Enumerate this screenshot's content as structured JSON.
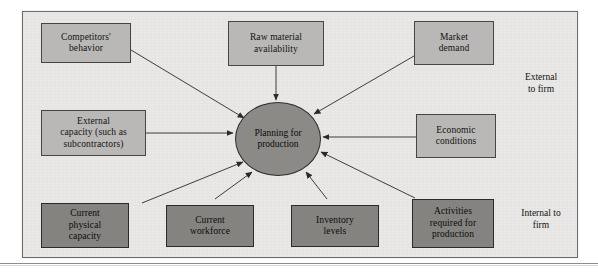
{
  "figure": {
    "hub": {
      "label": "Planning for\nproduction",
      "name": "planning-for-production-hub"
    },
    "zones": [
      {
        "id": "external",
        "caption": "External\nto firm"
      },
      {
        "id": "internal",
        "caption": "Internal to\nfirm"
      }
    ],
    "nodes": [
      {
        "id": "competitors-behavior",
        "label": "Competitors'\nbehavior",
        "zone": "external"
      },
      {
        "id": "raw-material-availability",
        "label": "Raw material\navailability",
        "zone": "external"
      },
      {
        "id": "market-demand",
        "label": "Market\ndemand",
        "zone": "external"
      },
      {
        "id": "external-capacity",
        "label": "External\ncapacity (such as\nsubcontractors)",
        "zone": "external"
      },
      {
        "id": "economic-conditions",
        "label": "Economic\nconditions",
        "zone": "external"
      },
      {
        "id": "current-physical-capacity",
        "label": "Current\nphysical\ncapacity",
        "zone": "internal"
      },
      {
        "id": "current-workforce",
        "label": "Current\nworkforce",
        "zone": "internal"
      },
      {
        "id": "inventory-levels",
        "label": "Inventory\nlevels",
        "zone": "internal"
      },
      {
        "id": "activities-required",
        "label": "Activities\nrequired for\nproduction",
        "zone": "internal"
      }
    ],
    "colors": {
      "panel_background": "#e9e8e6",
      "panel_border": "#6e6d6b",
      "external_box_fill": "#b9b8b6",
      "internal_box_fill": "#84837f",
      "hub_fill": "#8b8a86",
      "connector_stroke": "#2b2a28",
      "text": "#14120f"
    }
  }
}
